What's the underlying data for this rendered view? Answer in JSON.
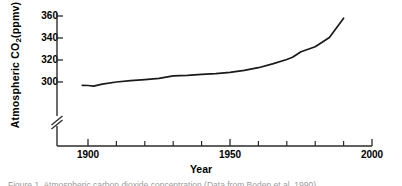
{
  "figure": {
    "background_color": "#ffffff",
    "line_color": "#1a1a1a",
    "axis_color": "#2b2b2b",
    "caption_clipped": "Figure 1. Atmospheric carbon dioxide concentration (Data from Boden et al. 1990)"
  },
  "chart_data": {
    "type": "line",
    "title": "",
    "xlabel": "Year",
    "ylabel": "Atmospheric CO2(ppmv)",
    "ylabel_rich": {
      "prefix": "Atmospheric  CO",
      "subscript": "2",
      "suffix": "(ppmv)"
    },
    "xlim": [
      1890,
      2000
    ],
    "ylim": [
      292,
      364
    ],
    "y_axis_break": true,
    "y_axis_break_note": "axis broken below 300 ppmv",
    "grid": false,
    "legend": false,
    "xticks_major": [
      1900,
      1950,
      2000
    ],
    "xticklabels_major": [
      "1900",
      "1950",
      "2000"
    ],
    "xticks_minor": [
      1910,
      1920,
      1930,
      1940,
      1960,
      1970,
      1980,
      1990
    ],
    "yticks": [
      300,
      320,
      340,
      360
    ],
    "yticklabels": [
      "300",
      "320",
      "340",
      "360"
    ],
    "series": [
      {
        "name": "Atmospheric CO2",
        "x": [
          1898,
          1900,
          1902,
          1905,
          1910,
          1915,
          1920,
          1925,
          1930,
          1935,
          1940,
          1945,
          1950,
          1955,
          1960,
          1965,
          1970,
          1972,
          1975,
          1980,
          1985,
          1990
        ],
        "values": [
          297.0,
          296.8,
          296.3,
          298.0,
          300.0,
          301.2,
          302.2,
          303.3,
          305.6,
          306.0,
          307.0,
          307.6,
          308.8,
          310.5,
          313.0,
          316.5,
          320.5,
          322.5,
          327.5,
          332.0,
          340.5,
          358.0
        ]
      }
    ]
  },
  "axis_labels": {
    "y": [
      "360",
      "340",
      "320",
      "300"
    ],
    "x": [
      "1900",
      "1950",
      "2000"
    ],
    "x_title": "Year"
  }
}
